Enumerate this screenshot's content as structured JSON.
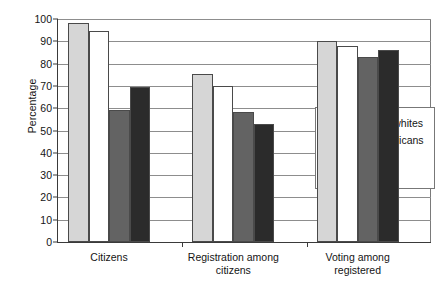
{
  "chart_data": {
    "type": "bar",
    "title": "",
    "xlabel": "",
    "ylabel": "Percentage",
    "ylim": [
      0,
      100
    ],
    "ytick_step": 10,
    "yticks": [
      0,
      10,
      20,
      30,
      40,
      50,
      60,
      70,
      80,
      90,
      100
    ],
    "grid": true,
    "legend_position": "inside-lower-right",
    "categories": [
      "Citizens",
      "Registration among\ncitizens",
      "Voting among\nregistered"
    ],
    "series": [
      {
        "name": "Non-Latino whites",
        "color": "#d6d6d6",
        "values": [
          98,
          75.5,
          90
        ]
      },
      {
        "name": "African Americans",
        "color": "#ffffff",
        "values": [
          94.5,
          70,
          88
        ]
      },
      {
        "name": "Latinos",
        "color": "#636363",
        "values": [
          59,
          58.5,
          83
        ]
      },
      {
        "name": "Asians",
        "color": "#2b2b2b",
        "values": [
          69.5,
          53,
          86
        ]
      }
    ]
  }
}
